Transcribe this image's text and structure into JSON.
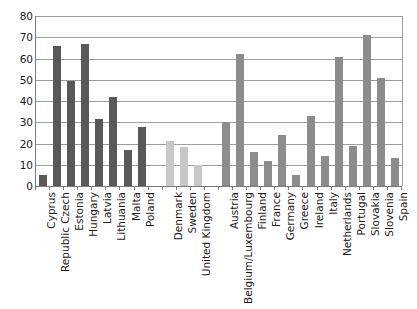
{
  "chart_data": {
    "type": "bar",
    "title": "",
    "subtitle": "",
    "xlabel": "",
    "ylabel": "",
    "ylim": [
      0,
      80
    ],
    "ytick_labels": [
      "0",
      "10",
      "20",
      "30",
      "40",
      "50",
      "60",
      "70",
      "80"
    ],
    "ytick_values": [
      0,
      10,
      20,
      30,
      40,
      50,
      60,
      70,
      80
    ],
    "grid": true,
    "legend": "none",
    "categories": [
      "Cyprus",
      "Republic Czech",
      "Estonia",
      "Hungary",
      "Latvia",
      "Lithuania",
      "Malta",
      "Poland",
      "",
      "Denmark",
      "Sweden",
      "United Kingdom",
      "",
      "Austria",
      "Belgium/Luxembourg",
      "Finland",
      "France",
      "Germany",
      "Greece",
      "Ireland",
      "Italy",
      "Netherlands",
      "Portugal",
      "Slovakia",
      "Slovenia",
      "Spain"
    ],
    "values": [
      5,
      66,
      49.5,
      67,
      31.5,
      42,
      17,
      28,
      null,
      21,
      18.5,
      10,
      null,
      30,
      62,
      16,
      12,
      24,
      5,
      33,
      14,
      60.5,
      19,
      71,
      51,
      13
    ],
    "group_colors": {
      "group_1": "#595959",
      "group_2": "#c8c8c8",
      "group_3": "#8c8c8c"
    },
    "bar_colors": [
      "#595959",
      "#595959",
      "#595959",
      "#595959",
      "#595959",
      "#595959",
      "#595959",
      "#595959",
      null,
      "#c8c8c8",
      "#c8c8c8",
      "#c8c8c8",
      null,
      "#8c8c8c",
      "#8c8c8c",
      "#8c8c8c",
      "#8c8c8c",
      "#8c8c8c",
      "#8c8c8c",
      "#8c8c8c",
      "#8c8c8c",
      "#8c8c8c",
      "#8c8c8c",
      "#8c8c8c",
      "#8c8c8c",
      "#8c8c8c"
    ],
    "axis_color": "#7a7a7a",
    "gridline_color": "#9d9d9d",
    "background_color": "#ffffff",
    "text_color": "#1a1a1a"
  }
}
